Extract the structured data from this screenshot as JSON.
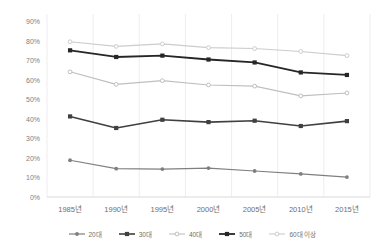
{
  "chart_data": {
    "type": "line",
    "title": "",
    "xlabel": "",
    "ylabel": "",
    "categories": [
      "1985년",
      "1990년",
      "1995년",
      "2000년",
      "2005년",
      "2010년",
      "2015년"
    ],
    "ylim": [
      0,
      90
    ],
    "yticks": [
      "0%",
      "10%",
      "20%",
      "30%",
      "40%",
      "50%",
      "60%",
      "70%",
      "80%",
      "90%"
    ],
    "ytick_values": [
      0,
      10,
      20,
      30,
      40,
      50,
      60,
      70,
      80,
      90
    ],
    "grid": "vertical-only",
    "legend_position": "bottom",
    "series": [
      {
        "name": "20대",
        "values": [
          18.8,
          14.5,
          14.3,
          14.8,
          13.3,
          11.8,
          10.2
        ],
        "color": "#7F7F7F",
        "marker": "circle",
        "line_width": 1.2
      },
      {
        "name": "30대",
        "values": [
          41.2,
          35.3,
          39.5,
          38.3,
          39.0,
          36.3,
          38.8
        ],
        "color": "#404040",
        "marker": "square",
        "line_width": 1.6
      },
      {
        "name": "40대",
        "values": [
          64.0,
          57.6,
          59.5,
          57.3,
          56.7,
          51.7,
          53.2
        ],
        "color": "#BFBFBF",
        "marker": "circle-open",
        "line_width": 1.1
      },
      {
        "name": "50대",
        "values": [
          75.0,
          71.6,
          72.3,
          70.3,
          68.8,
          63.7,
          62.4
        ],
        "color": "#262626",
        "marker": "square",
        "line_width": 1.8
      },
      {
        "name": "60대 이상",
        "values": [
          79.4,
          77.0,
          78.3,
          76.4,
          75.9,
          74.4,
          72.3
        ],
        "color": "#CCCCCC",
        "marker": "circle-open",
        "line_width": 1.1
      }
    ]
  },
  "axis": {
    "axis_line_color": "#D9D9D9",
    "gridline_color": "#EDEDED",
    "tick_label_color": "#808080"
  }
}
